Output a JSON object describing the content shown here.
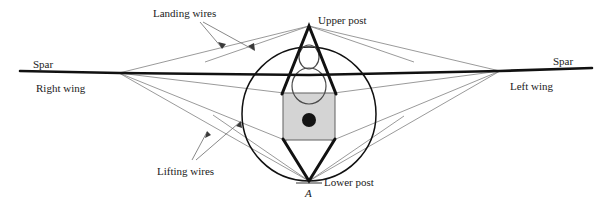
{
  "figure": {
    "background_color": "#ffffff",
    "width": 612,
    "height": 199
  },
  "colors": {
    "heavy_line": "#111111",
    "wire_line": "#777777",
    "body_fill": "#d4d4d4",
    "body_stroke": "#555555",
    "mass_dot": "#141414",
    "text": "#1b1b1b",
    "circle_stroke": "#111111",
    "figure_outline": "#333333"
  },
  "labels": {
    "landing_wires": "Landing wires",
    "lifting_wires": "Lifting wires",
    "upper_post": "Upper post",
    "lower_post": "Lower post",
    "spar_left": "Spar",
    "spar_right": "Spar",
    "right_wing": "Right wing",
    "left_wing": "Left wing",
    "point_a": "A"
  },
  "geometry": {
    "spar": {
      "left_tip_x": 20,
      "left_tip_y": 71,
      "left_joint_x": 119,
      "left_joint_y": 73,
      "center_x": 309,
      "center_y": 75,
      "right_joint_x": 500,
      "right_joint_y": 71,
      "right_tip_x": 592,
      "right_tip_y": 68
    },
    "upper_post": {
      "apex_x": 309,
      "apex_y": 26,
      "base_left_x": 282,
      "base_left_y": 93,
      "base_right_x": 336,
      "base_right_y": 93
    },
    "lower_post": {
      "apex_x": 309,
      "apex_y": 181,
      "base_left_x": 283,
      "base_left_y": 140,
      "base_right_x": 335,
      "base_right_y": 140
    },
    "circle": {
      "center_x": 309,
      "center_y": 114,
      "radius": 67
    },
    "body_box": {
      "x": 283,
      "y": 93,
      "width": 52,
      "height": 47
    },
    "mass_dot": {
      "center_x": 309,
      "center_y": 120,
      "radius": 7
    },
    "pilot_head": {
      "center_x": 309,
      "center_y": 57,
      "rx": 10,
      "ry": 12
    },
    "pilot_shoulders": {
      "center_x": 309,
      "center_y": 86,
      "rx": 17,
      "ry": 18
    }
  },
  "annotations": {
    "landing_wire_leader_origin_x": 200,
    "landing_wire_leader_origin_y": 22,
    "lifting_wire_leader_origin_x": 190,
    "lifting_wire_leader_origin_y": 158
  }
}
